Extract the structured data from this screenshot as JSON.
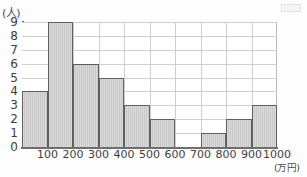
{
  "figure": {
    "y_unit_label": "(人)",
    "x_unit_label": "(万円)",
    "corner_mark": "scan-artifact"
  },
  "chart_data": {
    "type": "bar",
    "title": "",
    "subtitle": "",
    "xlabel": "(万円)",
    "ylabel": "(人)",
    "grid": true,
    "legend": false,
    "legend_position": "none",
    "bin_width": 100,
    "bin_edges": [
      0,
      100,
      200,
      300,
      400,
      500,
      600,
      700,
      800,
      900,
      1000
    ],
    "categories": [
      "0-100",
      "100-200",
      "200-300",
      "300-400",
      "400-500",
      "500-600",
      "600-700",
      "700-800",
      "800-900",
      "900-1000"
    ],
    "values": [
      4,
      9,
      6,
      5,
      3,
      2,
      0,
      1,
      2,
      3
    ],
    "x_tick_labels": [
      "100",
      "200",
      "300",
      "400",
      "500",
      "600",
      "700",
      "800",
      "900",
      "1000"
    ],
    "y_tick_labels": [
      "0",
      "1",
      "2",
      "3",
      "4",
      "5",
      "6",
      "7",
      "8",
      "9"
    ],
    "xlim": [
      0,
      1000
    ],
    "ylim": [
      0,
      9
    ],
    "total_count": 35,
    "colors": {
      "bar_fill": "#c9c9c9",
      "bar_outline": "#5f5f5f",
      "grid": "#cfcfcf",
      "axis": "#6e6e6e",
      "text": "#3d3d3d",
      "background": "#ffffff"
    }
  }
}
